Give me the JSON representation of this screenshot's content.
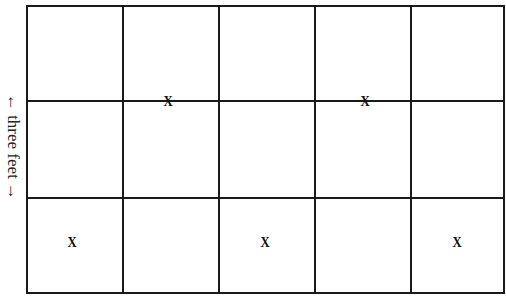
{
  "diagram": {
    "side_label": "← three feet →",
    "grid": {
      "columns": 5,
      "rows": 3
    },
    "marks": [
      {
        "label": "X",
        "x": 168,
        "y": 101
      },
      {
        "label": "X",
        "x": 365,
        "y": 101
      },
      {
        "label": "X",
        "x": 72,
        "y": 242
      },
      {
        "label": "X",
        "x": 265,
        "y": 242
      },
      {
        "label": "X",
        "x": 457,
        "y": 242
      }
    ]
  }
}
